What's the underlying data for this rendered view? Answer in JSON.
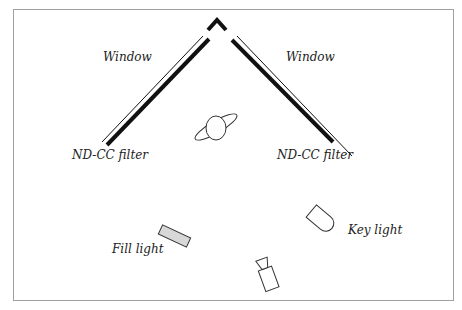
{
  "diagram": {
    "labels": {
      "window_left": "Window",
      "window_right": "Window",
      "filter_left": "ND-CC filter",
      "filter_right": "ND-CC filter",
      "fill_light": "Fill light",
      "key_light": "Key light"
    },
    "colors": {
      "frame": "#9a9a9a",
      "line": "#111111",
      "fill_light_body": "#d8d8d8"
    }
  }
}
